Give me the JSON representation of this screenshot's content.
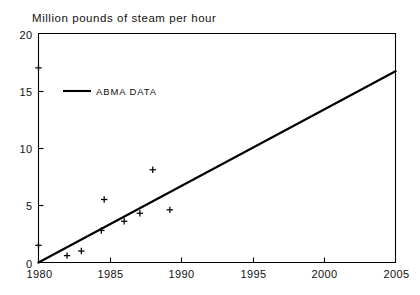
{
  "chart_data": {
    "type": "scatter",
    "title": "Million pounds of steam per hour",
    "xlabel": "",
    "ylabel": "",
    "xlim": [
      1980,
      2005
    ],
    "ylim": [
      0,
      20
    ],
    "xticks": [
      1980,
      1985,
      1990,
      1995,
      2000,
      2005
    ],
    "xtick_labels": [
      "1980",
      "1985",
      "1990",
      "1995",
      "2000",
      "2005"
    ],
    "yticks": [
      0,
      5,
      10,
      15,
      20
    ],
    "ytick_labels": [
      "0",
      "5",
      "10",
      "15",
      "20"
    ],
    "grid": false,
    "legend_position": "upper-left-inside",
    "legend": [
      {
        "label": "ABMA DATA",
        "marker": "line",
        "color": "#000000"
      }
    ],
    "series": [
      {
        "name": "ABMA DATA",
        "type": "line",
        "color": "#000000",
        "x": [
          1980,
          2005
        ],
        "y": [
          0,
          16.7
        ]
      },
      {
        "name": "Observations",
        "type": "scatter",
        "marker": "plus",
        "color": "#000000",
        "points": [
          {
            "x": 1980,
            "y": 17.0
          },
          {
            "x": 1980,
            "y": 1.5
          },
          {
            "x": 1982,
            "y": 0.6
          },
          {
            "x": 1983,
            "y": 1.0
          },
          {
            "x": 1984.4,
            "y": 2.8
          },
          {
            "x": 1984.6,
            "y": 5.5
          },
          {
            "x": 1986.0,
            "y": 3.6
          },
          {
            "x": 1987.1,
            "y": 4.3
          },
          {
            "x": 1988.0,
            "y": 8.1
          },
          {
            "x": 1989.2,
            "y": 4.6
          }
        ]
      }
    ]
  }
}
